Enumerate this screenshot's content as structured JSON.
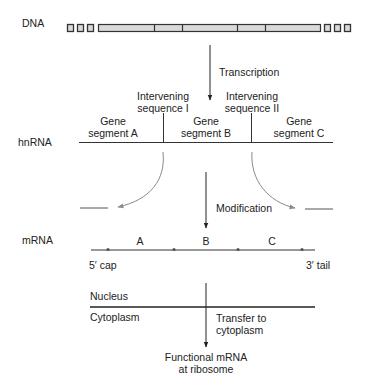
{
  "figure": {
    "colors": {
      "line": "#333333",
      "gray_arrow": "#8a8a8a",
      "dna_fill": "#d9d9d9",
      "text": "#222222"
    }
  },
  "dna": {
    "label": "DNA",
    "left_boxes": 3,
    "right_boxes": 3,
    "segments": 5
  },
  "transcription": {
    "label": "Transcription"
  },
  "hnrna": {
    "label": "hnRNA",
    "intervening_1": {
      "line1": "Intervening",
      "line2": "sequence I"
    },
    "intervening_2": {
      "line1": "Intervening",
      "line2": "sequence II"
    },
    "segment_a": {
      "line1": "Gene",
      "line2": "segment A"
    },
    "segment_b": {
      "line1": "Gene",
      "line2": "segment B"
    },
    "segment_c": {
      "line1": "Gene",
      "line2": "segment C"
    }
  },
  "modification": {
    "label": "Modification"
  },
  "mrna": {
    "label": "mRNA",
    "segments": [
      "A",
      "B",
      "C"
    ],
    "five_prime": "5′ cap",
    "three_prime": "3′  tail"
  },
  "compartments": {
    "nucleus": "Nucleus",
    "cytoplasm": "Cytoplasm",
    "transfer": {
      "line1": "Transfer to",
      "line2": "cytoplasm"
    }
  },
  "result": {
    "line1": "Functional mRNA",
    "line2": "at ribosome"
  }
}
